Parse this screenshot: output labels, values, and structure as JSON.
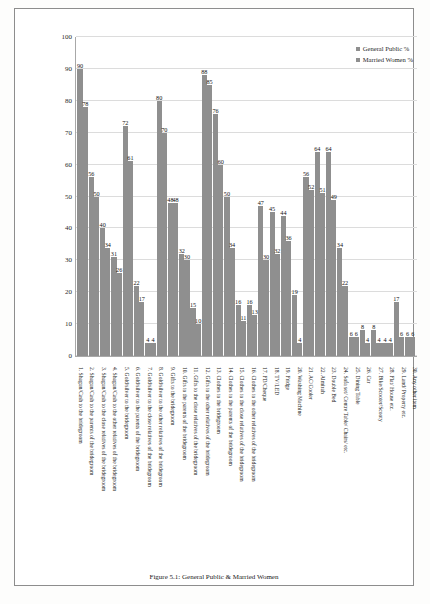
{
  "legend": {
    "items": [
      {
        "label": "General Public %",
        "color": "#8f8f8f"
      },
      {
        "label": "Married Women %",
        "color": "#8f8f8f"
      }
    ]
  },
  "caption": "Figure 5.1: General Public & Married Women",
  "chart_data": {
    "type": "bar",
    "title": "",
    "xlabel": "",
    "ylabel": "",
    "ylim": [
      0,
      100
    ],
    "ytick_step": 10,
    "yticks": [
      0,
      10,
      20,
      30,
      40,
      50,
      60,
      70,
      80,
      90,
      100
    ],
    "grid": true,
    "legend_position": "top-right",
    "categories": [
      "1.  Shagun/Cash to the bridegroom",
      "2.  Shagun/Cash to the parents of the bridegroom",
      "3.  Shagun/Cash to the close relatives of the bridegroom",
      "4.  Shagun/Cash to the other relatives of the bridegroom",
      "5.  Gold/silver to the bridegroom",
      "6.  Gold/silver to the parents of the bridegroom",
      "7.  Gold/silver to the close relatives of the bridegroom",
      "8.  Gold/silver to the other relatives of the bridegroom",
      "9.  Gifts to the bridegroom",
      "10.  Gifts to the parents of the bridegroom",
      "11.  Gifts to the close relatives of the bridegroom",
      "12.  Gifts to the other relatives of the bridegroom",
      "13.  Clothes to the bridegroom",
      "14.  Clothes to the parents of the bridegroom",
      "15.  Clothes to the close relatives of the bridegroom",
      "16.  Clothes to the other relatives of the bridegroom",
      "17.  FD/Cheque",
      "18.  TV/LED",
      "19.  Fridge",
      "20.  Washing Machine",
      "21.  AC/Cooler",
      "22.  Almirah",
      "23.  Double Bed",
      "24.  Sofa set/ Centre Table/ Chairs/ etc.",
      "25.  Dining Table",
      "26.  Car",
      "27.  Bike/Scooter/Scooty",
      "28.  Flat/ House etc.",
      "29.  Land/ Property etc.",
      "30.  Any other item"
    ],
    "series": [
      {
        "name": "General Public %",
        "values": [
          90,
          56,
          40,
          31,
          72,
          22,
          4,
          80,
          48,
          32,
          15,
          88,
          76,
          50,
          16,
          16,
          47,
          45,
          44,
          19,
          56,
          64,
          64,
          34,
          6,
          8,
          8,
          4,
          17,
          6
        ]
      },
      {
        "name": "Married Women %",
        "values": [
          78,
          50,
          34,
          26,
          61,
          17,
          4,
          70,
          48,
          30,
          10,
          85,
          60,
          34,
          11,
          13,
          30,
          32,
          36,
          4,
          52,
          51,
          49,
          22,
          6,
          4,
          4,
          4,
          6,
          6
        ]
      }
    ]
  }
}
